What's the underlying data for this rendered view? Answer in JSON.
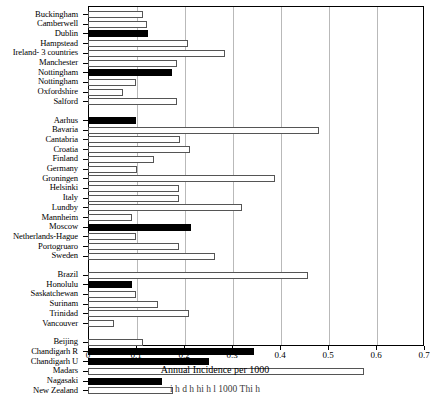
{
  "chart_data": {
    "type": "bar",
    "orientation": "horizontal",
    "title": "",
    "xlabel": "Annual Incidence per 1000",
    "ylabel": "",
    "xlim": [
      0,
      0.7
    ],
    "xticks": [
      0,
      0.1,
      0.2,
      0.3,
      0.4,
      0.5,
      0.6,
      0.7
    ],
    "xtick_labels": [
      "0",
      "0.1",
      "0.2",
      "0.3",
      "0.4",
      "0.5",
      "0.6",
      "0.7"
    ],
    "grid": "vertical",
    "legend": [],
    "series_note": "Filled (black) bars vs open (white) bars",
    "groups": [
      {
        "name": "group-1",
        "categories": [
          "Buckingham",
          "Camberwell",
          "Dublin",
          "Hampstead",
          "Ireland- 3 countries",
          "Manchester",
          "Nottingham",
          "Nottingham",
          "Oxfordshire",
          "Salford"
        ],
        "values": [
          0.115,
          0.122,
          0.125,
          0.208,
          0.285,
          0.185,
          0.175,
          0.1,
          0.073,
          0.185
        ],
        "fill": [
          "open",
          "open",
          "filled",
          "open",
          "open",
          "open",
          "filled",
          "open",
          "open",
          "open"
        ]
      },
      {
        "name": "group-2",
        "categories": [
          "Aarhus",
          "Bavaria",
          "Cantabria",
          "Croatia",
          "Finland",
          "Germany",
          "Groningen",
          "Helsinki",
          "Italy",
          "Lundby",
          "Mannheim",
          "Moscow",
          "Netherlands-Hague",
          "Portogruaro",
          "Sweden"
        ],
        "values": [
          0.1,
          0.482,
          0.192,
          0.212,
          0.138,
          0.102,
          0.39,
          0.19,
          0.19,
          0.32,
          0.092,
          0.215,
          0.1,
          0.19,
          0.265
        ],
        "fill": [
          "filled",
          "open",
          "open",
          "open",
          "open",
          "open",
          "open",
          "open",
          "open",
          "open",
          "open",
          "filled",
          "open",
          "open",
          "open"
        ]
      },
      {
        "name": "group-3",
        "categories": [
          "Brazil",
          "Honolulu",
          "Saskatchewan",
          "Surinam",
          "Trinidad",
          "Vancouver"
        ],
        "values": [
          0.458,
          0.092,
          0.1,
          0.145,
          0.21,
          0.055
        ],
        "fill": [
          "open",
          "filled",
          "open",
          "open",
          "open",
          "open"
        ]
      },
      {
        "name": "group-4",
        "categories": [
          "Beijing",
          "Chandigarh R",
          "Chandigarh U",
          "Madars",
          "Nagasaki",
          "New Zealand"
        ],
        "values": [
          0.115,
          0.345,
          0.252,
          0.575,
          0.155,
          0.178
        ],
        "fill": [
          "open",
          "filled",
          "filled",
          "open",
          "filled",
          "open"
        ]
      }
    ]
  },
  "figure": {
    "axis_label": "Annual Incidence per 1000",
    "caption_partial": "i    h              d     h     hi  h  l    1000  Thi       h"
  }
}
